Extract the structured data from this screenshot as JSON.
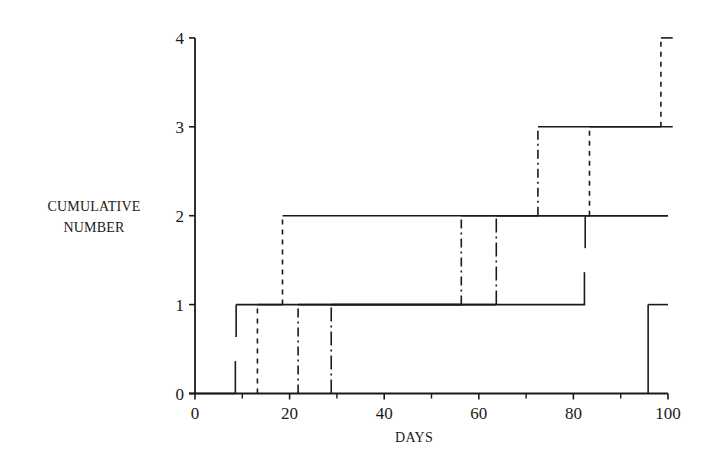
{
  "chart_data": {
    "type": "line",
    "subtype": "step",
    "title": "",
    "xlabel": "DAYS",
    "ylabel": "CUMULATIVE NUMBER",
    "ylabel_lines": [
      "CUMULATIVE",
      "NUMBER"
    ],
    "xlim": [
      0,
      100
    ],
    "ylim": [
      0,
      4
    ],
    "x_ticks": [
      0,
      20,
      40,
      60,
      80,
      100
    ],
    "x_minor_ticks": [
      10,
      30,
      50,
      70,
      90
    ],
    "y_ticks": [
      0,
      1,
      2,
      3,
      4
    ],
    "grid": false,
    "legend": null,
    "series": [
      {
        "name": "solid-1",
        "style": "solid",
        "steps": [
          {
            "x": 0,
            "y": 0
          },
          {
            "x": 8.7,
            "y": 1
          },
          {
            "x": 82.5,
            "y": 2
          }
        ],
        "end_x": 100,
        "gap_verticals": true
      },
      {
        "name": "solid-2",
        "style": "solid",
        "steps": [
          {
            "x": 0,
            "y": 0
          },
          {
            "x": 95.8,
            "y": 1
          }
        ],
        "end_x": 100
      },
      {
        "name": "dashed",
        "style": "dashed",
        "steps": [
          {
            "x": 0,
            "y": 0
          },
          {
            "x": 13.2,
            "y": 1
          },
          {
            "x": 18.5,
            "y": 2
          },
          {
            "x": 83.4,
            "y": 3
          },
          {
            "x": 98.5,
            "y": 4
          }
        ],
        "end_x": 101
      },
      {
        "name": "dash-dot",
        "style": "dash-dot",
        "steps": [
          {
            "x": 0,
            "y": 0
          },
          {
            "x": 21.8,
            "y": 1
          },
          {
            "x": 56.3,
            "y": 2
          },
          {
            "x": 72.5,
            "y": 3
          }
        ],
        "end_x": 101
      },
      {
        "name": "long-dash-dot",
        "style": "long-dash-dot",
        "steps": [
          {
            "x": 0,
            "y": 0
          },
          {
            "x": 28.8,
            "y": 1
          },
          {
            "x": 63.7,
            "y": 2
          }
        ],
        "end_x": 100
      }
    ]
  },
  "axes": {
    "x_tick_labels": [
      "0",
      "20",
      "40",
      "60",
      "80",
      "100"
    ],
    "y_tick_labels": [
      "0",
      "1",
      "2",
      "3",
      "4"
    ]
  },
  "colors": {
    "line": "#1a1a1a",
    "background": "#ffffff"
  }
}
